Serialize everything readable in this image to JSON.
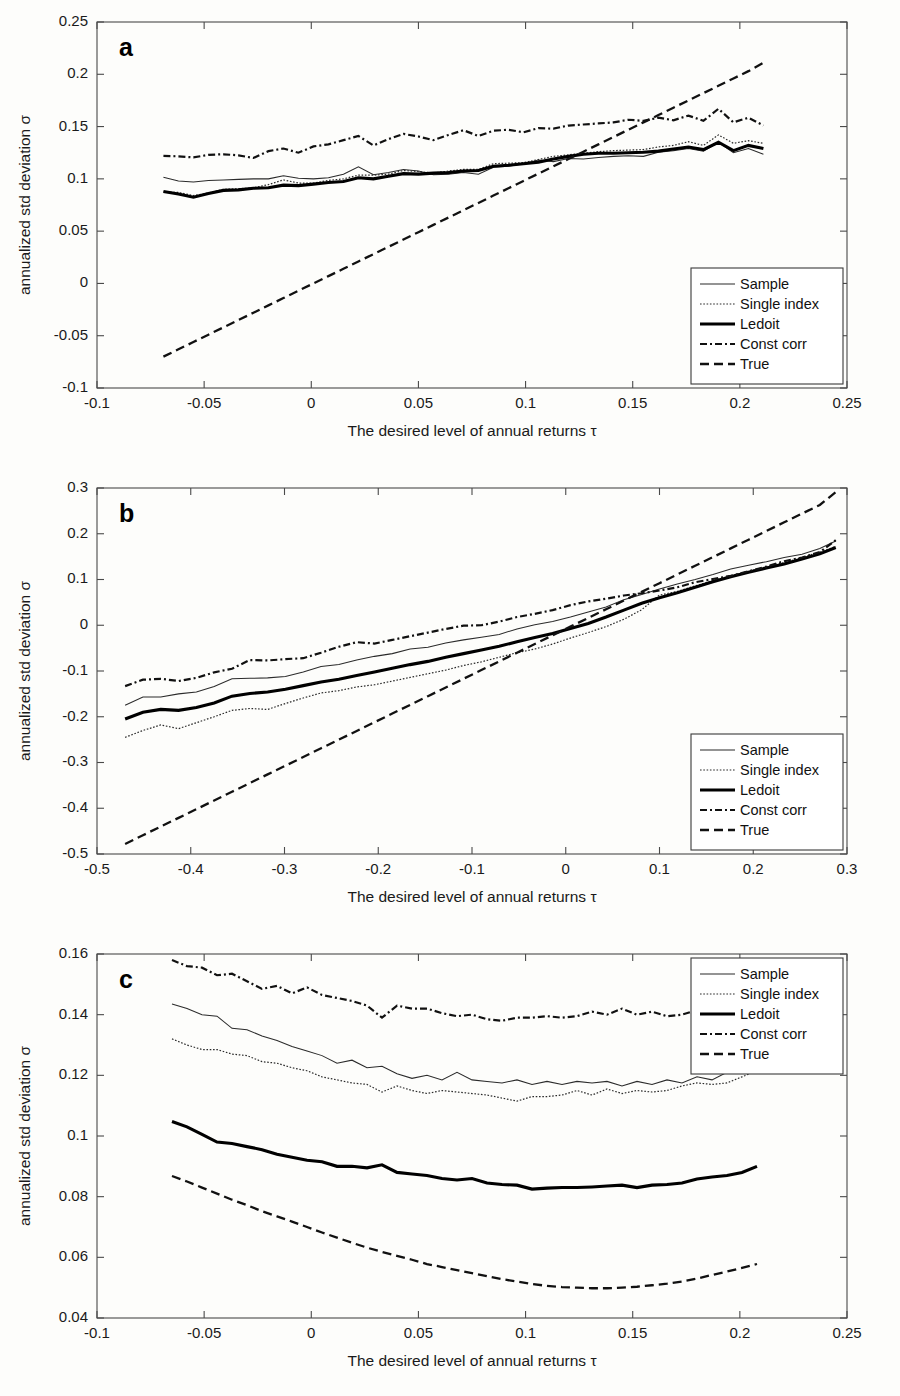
{
  "figure": {
    "panels": [
      "a",
      "b",
      "c"
    ],
    "axis_x_title": "The desired level of annual returns τ",
    "axis_y_title": "annualized std deviation σ"
  },
  "legend": {
    "entries": [
      {
        "label": "Sample",
        "style": "thin-solid"
      },
      {
        "label": "Single index",
        "style": "dotted"
      },
      {
        "label": "Ledoit",
        "style": "thick-solid"
      },
      {
        "label": "Const corr",
        "style": "dash-dot"
      },
      {
        "label": "True",
        "style": "dashed"
      }
    ]
  },
  "chart_data": [
    {
      "type": "line",
      "panel": "a",
      "title": "a",
      "xlabel": "The desired level of annual returns τ",
      "ylabel": "annualized std deviation σ",
      "xlim": [
        -0.1,
        0.25
      ],
      "ylim": [
        -0.1,
        0.25
      ],
      "xticks": [
        -0.1,
        -0.05,
        0,
        0.05,
        0.1,
        0.15,
        0.2,
        0.25
      ],
      "xticklabels": [
        "-0.1",
        "-0.05",
        "0",
        "0.05",
        "0.1",
        "0.15",
        "0.2",
        "0.25"
      ],
      "yticks": [
        -0.1,
        -0.05,
        0,
        0.05,
        0.1,
        0.15,
        0.2,
        0.25
      ],
      "yticklabels": [
        "-0.1",
        "-0.05",
        "0",
        "0.05",
        "0.1",
        "0.15",
        "0.2",
        "0.25"
      ],
      "grid": false,
      "legend_position": "lower-right",
      "x": [
        -0.069,
        -0.062,
        -0.055,
        -0.048,
        -0.041,
        -0.034,
        -0.027,
        -0.02,
        -0.013,
        -0.006,
        0.001,
        0.008,
        0.015,
        0.022,
        0.029,
        0.036,
        0.043,
        0.05,
        0.057,
        0.064,
        0.071,
        0.078,
        0.085,
        0.092,
        0.099,
        0.106,
        0.113,
        0.12,
        0.127,
        0.134,
        0.141,
        0.148,
        0.155,
        0.162,
        0.169,
        0.176,
        0.183,
        0.19,
        0.197,
        0.204,
        0.211
      ],
      "series": [
        {
          "name": "Sample",
          "values": [
            0.1015,
            0.098,
            0.097,
            0.0985,
            0.099,
            0.0995,
            0.1,
            0.1,
            0.103,
            0.1005,
            0.1,
            0.101,
            0.1045,
            0.1115,
            0.104,
            0.106,
            0.109,
            0.1075,
            0.104,
            0.1045,
            0.106,
            0.1045,
            0.111,
            0.112,
            0.1145,
            0.118,
            0.1165,
            0.1195,
            0.119,
            0.1205,
            0.1215,
            0.122,
            0.1215,
            0.1255,
            0.127,
            0.129,
            0.1265,
            0.135,
            0.125,
            0.129,
            0.1235
          ]
        },
        {
          "name": "Single index",
          "values": [
            0.0875,
            0.087,
            0.084,
            0.0865,
            0.09,
            0.0905,
            0.0915,
            0.0945,
            0.099,
            0.096,
            0.096,
            0.0985,
            0.1,
            0.1035,
            0.1035,
            0.1045,
            0.108,
            0.107,
            0.1055,
            0.1075,
            0.109,
            0.109,
            0.1145,
            0.115,
            0.1155,
            0.1185,
            0.1215,
            0.123,
            0.1245,
            0.126,
            0.127,
            0.1275,
            0.128,
            0.1305,
            0.132,
            0.1355,
            0.132,
            0.142,
            0.134,
            0.1365,
            0.134
          ]
        },
        {
          "name": "Ledoit",
          "values": [
            0.088,
            0.0855,
            0.0825,
            0.086,
            0.089,
            0.0895,
            0.091,
            0.0915,
            0.094,
            0.0935,
            0.095,
            0.0965,
            0.0975,
            0.101,
            0.1,
            0.1025,
            0.105,
            0.1045,
            0.1055,
            0.106,
            0.1075,
            0.108,
            0.112,
            0.113,
            0.1145,
            0.116,
            0.119,
            0.1215,
            0.1235,
            0.1245,
            0.1245,
            0.125,
            0.1255,
            0.1265,
            0.1285,
            0.1305,
            0.128,
            0.135,
            0.127,
            0.132,
            0.129
          ]
        },
        {
          "name": "Const corr",
          "values": [
            0.122,
            0.1215,
            0.1205,
            0.123,
            0.1235,
            0.1225,
            0.12,
            0.1265,
            0.129,
            0.125,
            0.131,
            0.133,
            0.137,
            0.141,
            0.132,
            0.138,
            0.143,
            0.1405,
            0.137,
            0.142,
            0.1465,
            0.141,
            0.146,
            0.147,
            0.1445,
            0.1485,
            0.148,
            0.151,
            0.152,
            0.153,
            0.154,
            0.1565,
            0.1555,
            0.1585,
            0.156,
            0.1605,
            0.1555,
            0.167,
            0.154,
            0.1585,
            0.151
          ]
        },
        {
          "name": "True",
          "values": [
            -0.07,
            -0.063,
            -0.056,
            -0.049,
            -0.042,
            -0.035,
            -0.028,
            -0.021,
            -0.014,
            -0.007,
            0.0,
            0.007,
            0.014,
            0.021,
            0.028,
            0.035,
            0.042,
            0.049,
            0.056,
            0.063,
            0.07,
            0.077,
            0.084,
            0.091,
            0.098,
            0.105,
            0.112,
            0.119,
            0.126,
            0.133,
            0.14,
            0.147,
            0.154,
            0.161,
            0.168,
            0.175,
            0.182,
            0.189,
            0.196,
            0.203,
            0.211
          ]
        }
      ]
    },
    {
      "type": "line",
      "panel": "b",
      "title": "b",
      "xlabel": "The desired level of annual returns τ",
      "ylabel": "annualized std deviation σ",
      "xlim": [
        -0.5,
        0.3
      ],
      "ylim": [
        -0.5,
        0.3
      ],
      "xticks": [
        -0.5,
        -0.4,
        -0.3,
        -0.2,
        -0.1,
        0,
        0.1,
        0.2,
        0.3
      ],
      "xticklabels": [
        "-0.5",
        "-0.4",
        "-0.3",
        "-0.2",
        "-0.1",
        "0",
        "0.1",
        "0.2",
        "0.3"
      ],
      "yticks": [
        -0.5,
        -0.4,
        -0.3,
        -0.2,
        -0.1,
        0,
        0.1,
        0.2,
        0.3
      ],
      "yticklabels": [
        "-0.5",
        "-0.4",
        "-0.3",
        "-0.2",
        "-0.1",
        "0",
        "0.1",
        "0.2",
        "0.3"
      ],
      "grid": false,
      "legend_position": "lower-right",
      "x": [
        -0.47,
        -0.451,
        -0.432,
        -0.413,
        -0.394,
        -0.375,
        -0.356,
        -0.337,
        -0.318,
        -0.299,
        -0.28,
        -0.261,
        -0.242,
        -0.223,
        -0.204,
        -0.185,
        -0.166,
        -0.147,
        -0.128,
        -0.109,
        -0.09,
        -0.071,
        -0.052,
        -0.033,
        -0.014,
        0.005,
        0.024,
        0.043,
        0.062,
        0.081,
        0.1,
        0.119,
        0.138,
        0.157,
        0.176,
        0.195,
        0.214,
        0.233,
        0.252,
        0.271,
        0.288
      ],
      "series": [
        {
          "name": "Sample",
          "values": [
            -0.175,
            -0.157,
            -0.157,
            -0.15,
            -0.146,
            -0.134,
            -0.117,
            -0.116,
            -0.115,
            -0.112,
            -0.102,
            -0.09,
            -0.086,
            -0.076,
            -0.068,
            -0.062,
            -0.052,
            -0.048,
            -0.039,
            -0.032,
            -0.026,
            -0.02,
            -0.008,
            0.001,
            0.008,
            0.018,
            0.029,
            0.04,
            0.056,
            0.067,
            0.079,
            0.09,
            0.1,
            0.111,
            0.123,
            0.131,
            0.139,
            0.148,
            0.155,
            0.168,
            0.184
          ]
        },
        {
          "name": "Single index",
          "values": [
            -0.245,
            -0.23,
            -0.218,
            -0.226,
            -0.213,
            -0.2,
            -0.186,
            -0.182,
            -0.184,
            -0.171,
            -0.159,
            -0.148,
            -0.143,
            -0.135,
            -0.13,
            -0.122,
            -0.114,
            -0.106,
            -0.098,
            -0.088,
            -0.08,
            -0.07,
            -0.06,
            -0.052,
            -0.041,
            -0.028,
            -0.016,
            -0.003,
            0.013,
            0.034,
            0.066,
            0.074,
            0.086,
            0.098,
            0.108,
            0.118,
            0.128,
            0.137,
            0.148,
            0.16,
            0.172
          ]
        },
        {
          "name": "Ledoit",
          "values": [
            -0.205,
            -0.19,
            -0.184,
            -0.186,
            -0.18,
            -0.17,
            -0.155,
            -0.149,
            -0.146,
            -0.14,
            -0.132,
            -0.124,
            -0.118,
            -0.11,
            -0.102,
            -0.094,
            -0.086,
            -0.079,
            -0.07,
            -0.062,
            -0.054,
            -0.046,
            -0.036,
            -0.027,
            -0.018,
            -0.007,
            0.004,
            0.018,
            0.033,
            0.048,
            0.06,
            0.071,
            0.083,
            0.095,
            0.106,
            0.116,
            0.125,
            0.134,
            0.145,
            0.156,
            0.17
          ]
        },
        {
          "name": "Const corr",
          "values": [
            -0.133,
            -0.119,
            -0.117,
            -0.122,
            -0.115,
            -0.103,
            -0.095,
            -0.076,
            -0.077,
            -0.074,
            -0.072,
            -0.06,
            -0.047,
            -0.037,
            -0.04,
            -0.032,
            -0.024,
            -0.016,
            -0.008,
            -0.001,
            0.0,
            0.008,
            0.018,
            0.025,
            0.033,
            0.044,
            0.052,
            0.058,
            0.065,
            0.07,
            0.076,
            0.083,
            0.094,
            0.101,
            0.108,
            0.118,
            0.128,
            0.14,
            0.148,
            0.16,
            0.186
          ]
        },
        {
          "name": "True",
          "values": [
            -0.478,
            -0.459,
            -0.44,
            -0.421,
            -0.402,
            -0.383,
            -0.364,
            -0.345,
            -0.326,
            -0.307,
            -0.288,
            -0.269,
            -0.25,
            -0.231,
            -0.212,
            -0.193,
            -0.174,
            -0.155,
            -0.136,
            -0.117,
            -0.098,
            -0.079,
            -0.06,
            -0.041,
            -0.022,
            -0.003,
            0.016,
            0.035,
            0.054,
            0.073,
            0.092,
            0.111,
            0.13,
            0.149,
            0.168,
            0.187,
            0.206,
            0.225,
            0.244,
            0.263,
            0.291
          ]
        }
      ]
    },
    {
      "type": "line",
      "panel": "c",
      "title": "c",
      "xlabel": "The desired level of annual returns τ",
      "ylabel": "annualized std deviation σ",
      "xlim": [
        -0.1,
        0.25
      ],
      "ylim": [
        0.04,
        0.16
      ],
      "xticks": [
        -0.1,
        -0.05,
        0,
        0.05,
        0.1,
        0.15,
        0.2,
        0.25
      ],
      "xticklabels": [
        "-0.1",
        "-0.05",
        "0",
        "0.05",
        "0.1",
        "0.15",
        "0.2",
        "0.25"
      ],
      "yticks": [
        0.04,
        0.06,
        0.08,
        0.1,
        0.12,
        0.14,
        0.16
      ],
      "yticklabels": [
        "0.04",
        "0.06",
        "0.08",
        "0.1",
        "0.12",
        "0.14",
        "0.16"
      ],
      "grid": false,
      "legend_position": "upper-right",
      "x": [
        -0.065,
        -0.058,
        -0.051,
        -0.044,
        -0.037,
        -0.03,
        -0.023,
        -0.016,
        -0.009,
        -0.002,
        0.005,
        0.012,
        0.019,
        0.026,
        0.033,
        0.04,
        0.047,
        0.054,
        0.061,
        0.068,
        0.075,
        0.082,
        0.089,
        0.096,
        0.103,
        0.11,
        0.117,
        0.124,
        0.131,
        0.138,
        0.145,
        0.152,
        0.159,
        0.166,
        0.173,
        0.18,
        0.187,
        0.194,
        0.201,
        0.208
      ],
      "series": [
        {
          "name": "Sample",
          "values": [
            0.1435,
            0.142,
            0.14,
            0.1395,
            0.1355,
            0.135,
            0.133,
            0.1315,
            0.1295,
            0.128,
            0.1265,
            0.124,
            0.125,
            0.1225,
            0.123,
            0.1205,
            0.119,
            0.12,
            0.1185,
            0.121,
            0.1185,
            0.118,
            0.1175,
            0.1185,
            0.117,
            0.118,
            0.117,
            0.118,
            0.1175,
            0.118,
            0.1165,
            0.118,
            0.117,
            0.1185,
            0.1175,
            0.1195,
            0.1185,
            0.121,
            0.122,
            0.1225
          ]
        },
        {
          "name": "Single index",
          "values": [
            0.132,
            0.13,
            0.1285,
            0.1285,
            0.127,
            0.1265,
            0.1245,
            0.124,
            0.1225,
            0.1215,
            0.1195,
            0.1185,
            0.1175,
            0.117,
            0.1145,
            0.1165,
            0.115,
            0.114,
            0.115,
            0.1145,
            0.114,
            0.1135,
            0.1125,
            0.1115,
            0.113,
            0.113,
            0.1135,
            0.115,
            0.1135,
            0.1155,
            0.114,
            0.115,
            0.1145,
            0.115,
            0.1165,
            0.1175,
            0.117,
            0.1175,
            0.1195,
            0.1215
          ]
        },
        {
          "name": "Ledoit",
          "values": [
            0.1048,
            0.103,
            0.1005,
            0.098,
            0.0975,
            0.0965,
            0.0955,
            0.094,
            0.093,
            0.092,
            0.0915,
            0.09,
            0.09,
            0.0895,
            0.0905,
            0.088,
            0.0875,
            0.087,
            0.086,
            0.0855,
            0.086,
            0.0845,
            0.084,
            0.0838,
            0.0825,
            0.0828,
            0.083,
            0.083,
            0.0832,
            0.0835,
            0.0838,
            0.083,
            0.0838,
            0.084,
            0.0845,
            0.0858,
            0.0865,
            0.087,
            0.088,
            0.09
          ]
        },
        {
          "name": "Const corr",
          "values": [
            0.158,
            0.156,
            0.1555,
            0.153,
            0.1535,
            0.151,
            0.1485,
            0.1495,
            0.147,
            0.149,
            0.1465,
            0.1455,
            0.1445,
            0.143,
            0.139,
            0.143,
            0.142,
            0.142,
            0.1405,
            0.1395,
            0.14,
            0.1385,
            0.138,
            0.139,
            0.139,
            0.1395,
            0.139,
            0.1395,
            0.141,
            0.14,
            0.142,
            0.14,
            0.141,
            0.1395,
            0.14,
            0.1415,
            0.1425,
            0.1425,
            0.142,
            0.142
          ]
        },
        {
          "name": "True",
          "values": [
            0.0868,
            0.085,
            0.083,
            0.081,
            0.079,
            0.0772,
            0.0752,
            0.0735,
            0.0718,
            0.07,
            0.0682,
            0.0665,
            0.0648,
            0.0632,
            0.0618,
            0.0605,
            0.0592,
            0.0578,
            0.0568,
            0.0558,
            0.0548,
            0.0538,
            0.0528,
            0.052,
            0.0512,
            0.0506,
            0.0502,
            0.05,
            0.0498,
            0.0498,
            0.05,
            0.0503,
            0.0508,
            0.0513,
            0.052,
            0.053,
            0.0542,
            0.0553,
            0.0565,
            0.0578
          ]
        }
      ]
    }
  ]
}
